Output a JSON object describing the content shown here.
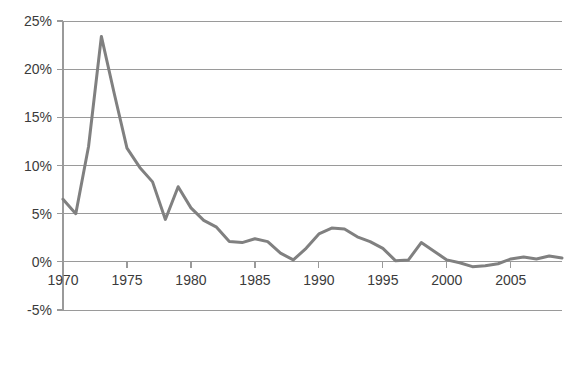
{
  "chart_data": {
    "type": "line",
    "title": "",
    "subtitle": "",
    "xlabel": "",
    "ylabel": "",
    "xlim": [
      1970,
      2009
    ],
    "ylim": [
      -5,
      25
    ],
    "grid": true,
    "legend": null,
    "legend_position": "none",
    "line_color": "#808080",
    "grid_color": "#9a9a9a",
    "background_color": "#ffffff",
    "y_tick_labels": [
      "25%",
      "20%",
      "15%",
      "10%",
      "5%",
      "0%",
      "-5%"
    ],
    "y_tick_values": [
      25,
      20,
      15,
      10,
      5,
      0,
      -5
    ],
    "x_tick_labels": [
      "1970",
      "1975",
      "1980",
      "1985",
      "1990",
      "1995",
      "2000",
      "2005"
    ],
    "x_tick_values": [
      1970,
      1975,
      1980,
      1985,
      1990,
      1995,
      2000,
      2005
    ],
    "x": [
      1970,
      1971,
      1972,
      1973,
      1974,
      1975,
      1976,
      1977,
      1978,
      1979,
      1980,
      1981,
      1982,
      1983,
      1984,
      1985,
      1986,
      1987,
      1988,
      1989,
      1990,
      1991,
      1992,
      1993,
      1994,
      1995,
      1996,
      1997,
      1998,
      1999,
      2000,
      2001,
      2002,
      2003,
      2004,
      2005,
      2006,
      2007,
      2008,
      2009
    ],
    "values": [
      6.5,
      5.0,
      12.0,
      23.4,
      17.5,
      11.8,
      9.8,
      8.3,
      4.4,
      7.8,
      5.6,
      4.3,
      3.6,
      2.1,
      2.0,
      2.4,
      2.1,
      0.9,
      0.2,
      1.4,
      2.9,
      3.5,
      3.4,
      2.6,
      2.1,
      1.4,
      0.1,
      0.2,
      2.0,
      1.1,
      0.2,
      -0.1,
      -0.5,
      -0.4,
      -0.2,
      0.3,
      0.5,
      0.3,
      0.6,
      0.4
    ],
    "series": [
      {
        "name": "series-1",
        "values": [
          6.5,
          5.0,
          12.0,
          23.4,
          17.5,
          11.8,
          9.8,
          8.3,
          4.4,
          7.8,
          5.6,
          4.3,
          3.6,
          2.1,
          2.0,
          2.4,
          2.1,
          0.9,
          0.2,
          1.4,
          2.9,
          3.5,
          3.4,
          2.6,
          2.1,
          1.4,
          0.1,
          0.2,
          2.0,
          1.1,
          0.2,
          -0.1,
          -0.5,
          -0.4,
          -0.2,
          0.3,
          0.5,
          0.3,
          0.6,
          0.4
        ]
      }
    ]
  }
}
